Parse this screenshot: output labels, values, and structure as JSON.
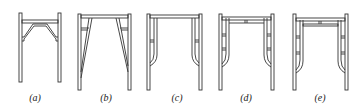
{
  "figure": {
    "panels": [
      {
        "id": "a",
        "label": "(a)",
        "x": 35
      },
      {
        "id": "b",
        "label": "(b)",
        "x": 106
      },
      {
        "id": "c",
        "label": "(c)",
        "x": 177
      },
      {
        "id": "d",
        "label": "(d)",
        "x": 246
      },
      {
        "id": "e",
        "label": "(e)",
        "x": 320
      }
    ]
  },
  "colors": {
    "stroke": "#333333",
    "background": "#ffffff"
  }
}
